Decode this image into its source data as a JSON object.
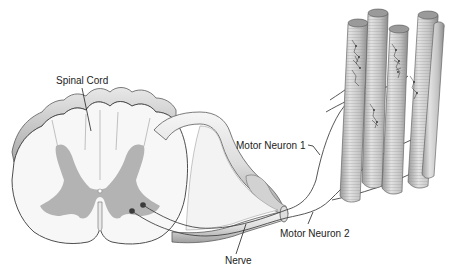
{
  "diagram": {
    "type": "anatomical-illustration",
    "labels": {
      "spinal_cord": "Spinal Cord",
      "motor_neuron_1": "Motor Neuron 1",
      "motor_neuron_2": "Motor Neuron 2",
      "nerve": "Nerve"
    },
    "colors": {
      "background": "#ffffff",
      "white_matter": "#f4f4f4",
      "gray_matter": "#b4b4b4",
      "outline": "#555555",
      "muscle_fiber": "#c9c9c9",
      "leader_line": "#222222"
    }
  }
}
